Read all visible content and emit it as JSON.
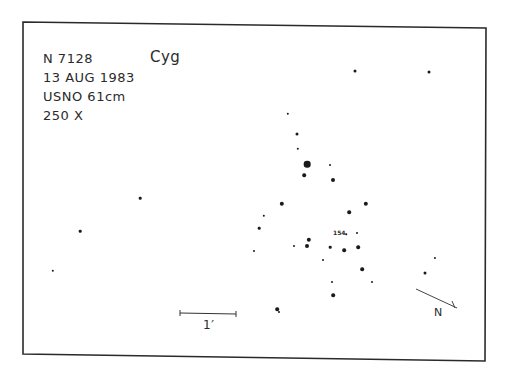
{
  "header": {
    "object": "N 7128",
    "date": "13 AUG 1983",
    "telescope": "USNO 61cm",
    "magnification": "250 X",
    "constellation": "Cyg"
  },
  "annotations": {
    "star_label": "154",
    "scale_label": "1′",
    "direction_label": "N"
  },
  "colors": {
    "ink": "#1a1a1a",
    "paper": "#ffffff",
    "border": "#2a2a2a"
  },
  "stars": [
    {
      "x": 355,
      "y": 71,
      "r": 1.5
    },
    {
      "x": 429,
      "y": 72,
      "r": 1.5
    },
    {
      "x": 288,
      "y": 114,
      "r": 1.2
    },
    {
      "x": 297,
      "y": 134,
      "r": 1.5
    },
    {
      "x": 298,
      "y": 149,
      "r": 1.2
    },
    {
      "x": 307,
      "y": 164,
      "r": 3.3
    },
    {
      "x": 330,
      "y": 165,
      "r": 1
    },
    {
      "x": 304,
      "y": 175,
      "r": 1.8
    },
    {
      "x": 333,
      "y": 180,
      "r": 2
    },
    {
      "x": 140,
      "y": 198,
      "r": 1.3
    },
    {
      "x": 282,
      "y": 204,
      "r": 2.2
    },
    {
      "x": 366,
      "y": 204,
      "r": 2.2
    },
    {
      "x": 349,
      "y": 212,
      "r": 1.8
    },
    {
      "x": 264,
      "y": 216,
      "r": 1.2
    },
    {
      "x": 259,
      "y": 228,
      "r": 1.3
    },
    {
      "x": 80,
      "y": 231,
      "r": 1.3
    },
    {
      "x": 346,
      "y": 234,
      "r": 0.8
    },
    {
      "x": 357,
      "y": 233,
      "r": 1
    },
    {
      "x": 309,
      "y": 240,
      "r": 2.2
    },
    {
      "x": 307,
      "y": 246,
      "r": 2
    },
    {
      "x": 294,
      "y": 246,
      "r": 1
    },
    {
      "x": 330,
      "y": 247,
      "r": 1.3
    },
    {
      "x": 344,
      "y": 250,
      "r": 1.8
    },
    {
      "x": 358,
      "y": 247,
      "r": 1.8
    },
    {
      "x": 254,
      "y": 251,
      "r": 1
    },
    {
      "x": 435,
      "y": 258,
      "r": 1.1
    },
    {
      "x": 323,
      "y": 260,
      "r": 1
    },
    {
      "x": 362,
      "y": 269,
      "r": 1.8
    },
    {
      "x": 53,
      "y": 271,
      "r": 1.2
    },
    {
      "x": 425,
      "y": 273,
      "r": 1.5
    },
    {
      "x": 332,
      "y": 282,
      "r": 1
    },
    {
      "x": 372,
      "y": 282,
      "r": 1
    },
    {
      "x": 333,
      "y": 295,
      "r": 1.8
    },
    {
      "x": 277,
      "y": 309,
      "r": 1.8
    },
    {
      "x": 279,
      "y": 312,
      "r": 1
    }
  ]
}
